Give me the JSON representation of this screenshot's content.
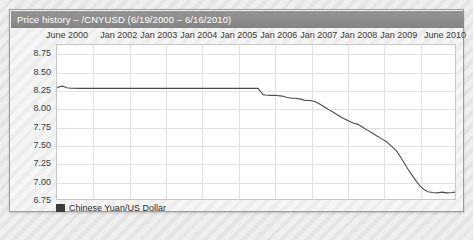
{
  "panel": {
    "title": "Price history – /CNYUSD (6/19/2000 – 6/16/2010)"
  },
  "legend": {
    "swatch_name": "series-color-swatch",
    "label": "Chinese Yuan/US Dollar",
    "color": "#3b3b3b"
  },
  "chart_data": {
    "type": "line",
    "title": "Price history – /CNYUSD (6/19/2000 – 6/16/2010)",
    "xlabel": "",
    "ylabel": "",
    "grid": true,
    "legend_position": "bottom-left",
    "xlim": [
      "June 2000",
      "June 2010"
    ],
    "ylim": [
      6.75,
      8.875
    ],
    "ytick_labels": [
      "8.75",
      "8.50",
      "8.25",
      "8.00",
      "7.75",
      "7.50",
      "7.25",
      "7.00",
      "6.75"
    ],
    "ytick_values": [
      8.75,
      8.5,
      8.25,
      8.0,
      7.75,
      7.5,
      7.25,
      7.0,
      6.75
    ],
    "xtick_labels": [
      "June 2000",
      "Jan 2002",
      "Jan 2003",
      "Jan 2004",
      "Jan 2005",
      "Jan 2006",
      "Jan 2007",
      "Jan 2008",
      "Jan 2009",
      "June 2010"
    ],
    "xtick_positions_frac": [
      0.015,
      0.157,
      0.257,
      0.357,
      0.457,
      0.557,
      0.657,
      0.757,
      0.857,
      0.985
    ],
    "series": [
      {
        "name": "Chinese Yuan/US Dollar",
        "color": "#4b4b4b",
        "x": [
          0.0,
          0.006,
          0.012,
          0.018,
          0.024,
          0.035,
          0.06,
          0.12,
          0.2,
          0.28,
          0.36,
          0.44,
          0.49,
          0.505,
          0.512,
          0.518,
          0.524,
          0.53,
          0.54,
          0.552,
          0.566,
          0.578,
          0.59,
          0.6,
          0.612,
          0.624,
          0.636,
          0.648,
          0.66,
          0.672,
          0.684,
          0.696,
          0.708,
          0.72,
          0.732,
          0.744,
          0.756,
          0.768,
          0.78,
          0.792,
          0.804,
          0.816,
          0.828,
          0.84,
          0.852,
          0.862,
          0.872,
          0.882,
          0.892,
          0.902,
          0.912,
          0.922,
          0.932,
          0.944,
          0.956,
          0.968,
          0.98,
          0.992,
          1.0
        ],
        "y": [
          8.28,
          8.3,
          8.307,
          8.3,
          8.285,
          8.278,
          8.277,
          8.277,
          8.277,
          8.277,
          8.277,
          8.277,
          8.277,
          8.277,
          8.23,
          8.19,
          8.185,
          8.182,
          8.18,
          8.178,
          8.17,
          8.15,
          8.14,
          8.14,
          8.128,
          8.11,
          8.11,
          8.095,
          8.06,
          8.02,
          7.98,
          7.94,
          7.9,
          7.86,
          7.83,
          7.8,
          7.78,
          7.74,
          7.7,
          7.66,
          7.62,
          7.58,
          7.54,
          7.48,
          7.42,
          7.34,
          7.25,
          7.16,
          7.08,
          7.0,
          6.93,
          6.88,
          6.85,
          6.84,
          6.835,
          6.845,
          6.835,
          6.84,
          6.845
        ]
      }
    ]
  }
}
